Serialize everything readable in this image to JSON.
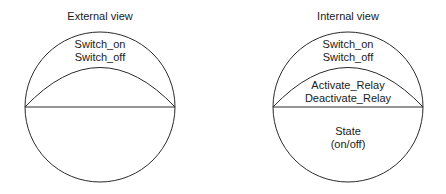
{
  "external_view": {
    "title": "External view",
    "top_labels": [
      "Switch_on",
      "Switch_off"
    ]
  },
  "internal_view": {
    "title": "Internal view",
    "top_labels": [
      "Switch_on",
      "Switch_off"
    ],
    "middle_labels": [
      "Activate_Relay",
      "Deactivate_Relay"
    ],
    "bottom_labels": [
      "State",
      "(on/off)"
    ]
  },
  "colors": {
    "stroke": "#2a2a2a",
    "text": "#1a1a1a",
    "background": "#ffffff"
  }
}
